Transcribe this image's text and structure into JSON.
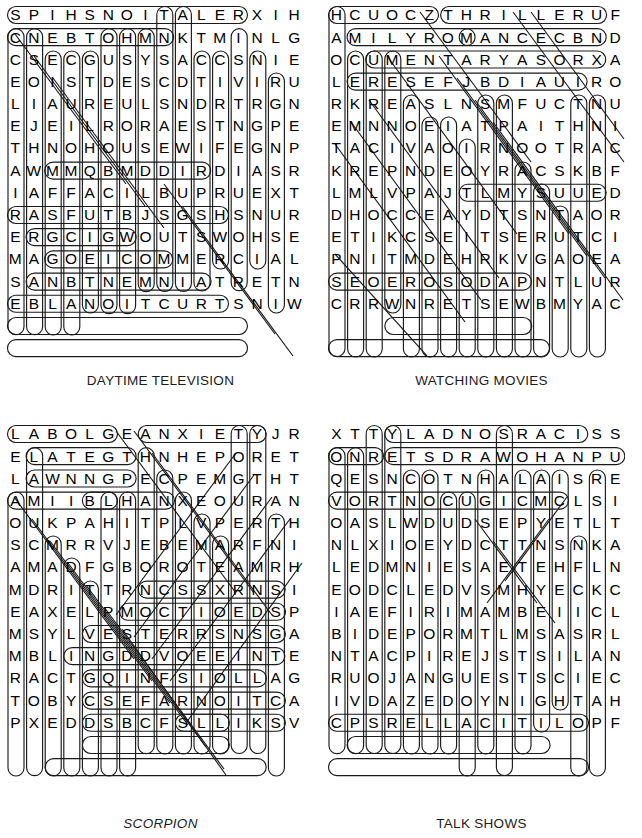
{
  "page": {
    "kind": "word-search-puzzle-sheet",
    "puzzle_count": 4,
    "grid_size": "16x16"
  },
  "puzzles": [
    {
      "id": "daytime-television",
      "caption": "DAYTIME TELEVISION",
      "caption_style": "normal",
      "position": "top-left",
      "rows": [
        "SPIHSNOITALERX",
        "IHCNEBTOHMNKTM",
        "INLGCSECGUSYSA",
        "CCSNIEEOISTDES",
        "CDTIVIRULIAURE",
        "ULSNDRTRGNEJEI",
        "LRORAESTNGPETH",
        "NOHOUSEWIFEGNP",
        "AWMMQBMDDIRDIA",
        "SRIAFFACILBUPR",
        "UEXTRASFUTBJSG",
        "SHSNURERGCIGWO",
        "UTSWOHSEMAGOEI",
        "COMMERCIALSANB",
        "TNEMNIATRETNEB",
        "LANOITCURTSNIW"
      ],
      "row_strings": [
        "S P I H S N O I T A L E R X",
        "I H C N E B T O H M N K T M",
        "I N L G C S E C G U S Y S A",
        "C C S N I E E O I S T D E S",
        "C D T I V I R U L I A U R E",
        "U L S N D R T R G N E J E I",
        "L R O R A E S T N G P E T H",
        "N O H O U S E W I F E G N P",
        "A W M M Q B M D D I R D I A",
        "S R I A F F A C I L B U P R",
        "U E X T R A S F U T B J S G",
        "S H S N U R E R G C I G W O",
        "U T S W O H S E M A G O E I",
        "C O M M E R C I A L S A N B",
        "T N E M N I A T R E T N E B",
        "L A N O I T C U R T S N I W"
      ]
    },
    {
      "id": "watching-movies",
      "caption": "WATCHING MOVIES",
      "caption_style": "normal",
      "position": "top-right",
      "rows": [
        "HCUOCZTHRILLER",
        "UFAMILYROMANCE",
        "CBNDOCUMENTARY",
        "ASORXALERESEFJ",
        "BDIAUIRORKREAS",
        "LNSMFUCTNUEMNN",
        "OEIATPAITHNITA",
        "CIVAOIRNOOTRAC",
        "KREPNDEOYRACSK",
        "BFLMLVPAJTLMYS",
        "UUEDDHOCCEAYDT",
        "SNTAORETIKCSEI",
        "TSERUTCIPNITMD",
        "EHRKVGAOEASEOE",
        "ROSODAPNTLURCR",
        "RWNRETSEWBMYAC"
      ]
    },
    {
      "id": "scorpion",
      "caption": "SCORPION",
      "caption_style": "italic",
      "position": "bottom-left",
      "rows": [
        "LABOLGEANXIETY",
        "JRELATEGTHNHEP",
        "ORETLAWNNGPECP",
        "EMGTHTAMIIBLHA",
        "NXEOURANOUKPAH",
        "ITPLVPERTHSCMR",
        "RVJEBEMARFNIAM",
        "ADFGBOROTEAMRH",
        "MDRITTRNCSSXRN",
        "SIEAXELPMOCTIO",
        "EDSPMSYLVESTER",
        "RSNSGAMBLINGDD",
        "VOEEINTERACTGQ",
        "INFSIOLLAGTOBY",
        "CSEFARNOITCAPX",
        "EDDSBCFSLLIKSV"
      ]
    },
    {
      "id": "talk-shows",
      "caption": "TALK SHOWS",
      "caption_style": "normal",
      "position": "bottom-right",
      "rows": [
        "XTTYLADNOSRACI",
        "SSONRETSDRAWOH",
        "ANPUQESNCOTNHA",
        "LAISREVORTNOCU",
        "GICMCLSIOASLWD",
        "UDSEPYETLTNLXI",
        "OEYDCTTNSNKALE",
        "DMNIESAETEHFLN",
        "EODCLEDVSMHYEC",
        "KCIAEFIRIMAMBE",
        "IICLBIDEPORMTL",
        "MSASRLNTACPIRE",
        "JSTSILANRUOJAN",
        "GUESTSCIECIVDA",
        "ZEDOYNIGHTAHCP",
        "SRELLACITILOPF"
      ]
    }
  ]
}
